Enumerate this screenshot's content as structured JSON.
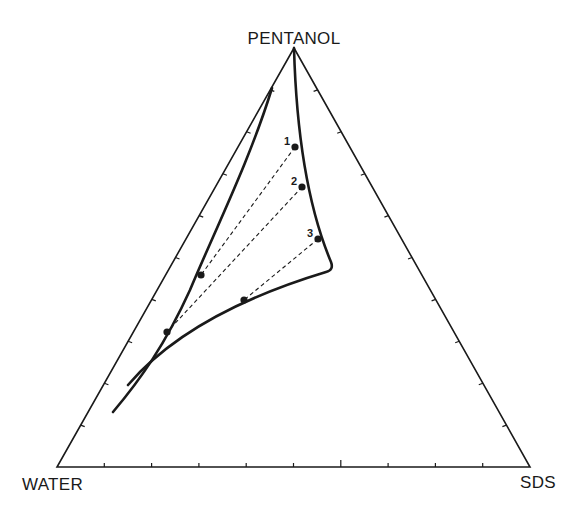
{
  "diagram": {
    "type": "ternary-phase-diagram",
    "vertices": {
      "top": {
        "label": "PENTANOL",
        "x": 294,
        "y": 48
      },
      "left": {
        "label": "WATER",
        "x": 57,
        "y": 467
      },
      "right": {
        "label": "SDS",
        "x": 530,
        "y": 467
      }
    },
    "ticks_per_edge": 9,
    "colors": {
      "line": "#1a1a1a",
      "background": "#ffffff"
    },
    "regions": [
      {
        "name": "single-phase-boundary-left",
        "path": "M272,88 C250,160 215,230 190,290 C165,345 140,380 113,412"
      },
      {
        "name": "single-phase-boundary-right",
        "path": "M294,48 C296,120 305,200 331,262 Q334,270 326,272 C250,295 175,330 128,385"
      }
    ],
    "tie_lines": [
      {
        "label": "1",
        "from": {
          "x": 295,
          "y": 147
        },
        "to": {
          "x": 201,
          "y": 275
        }
      },
      {
        "label": "2",
        "from": {
          "x": 302,
          "y": 187
        },
        "to": {
          "x": 167,
          "y": 332
        }
      },
      {
        "label": "3",
        "from": {
          "x": 318,
          "y": 239
        },
        "to": {
          "x": 244,
          "y": 300
        }
      }
    ]
  },
  "chart_data": {
    "type": "ternary",
    "title": "",
    "axes": [
      "PENTANOL",
      "WATER",
      "SDS"
    ],
    "tie_lines": [
      {
        "label": "1",
        "points": 2
      },
      {
        "label": "2",
        "points": 2
      },
      {
        "label": "3",
        "points": 2
      }
    ],
    "grid": false,
    "tick_divisions": 10
  }
}
